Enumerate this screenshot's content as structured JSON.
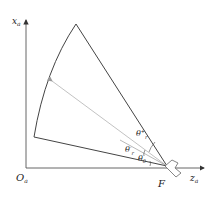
{
  "diagram": {
    "axes": {
      "vertical_label": "x",
      "vertical_subscript": "a",
      "horizontal_label": "z",
      "horizontal_subscript": "a",
      "origin_label": "O",
      "origin_subscript": "a"
    },
    "focus_label": "F",
    "angles": [
      {
        "symbol": "θ",
        "superscript": "+",
        "subscript": "r",
        "name": "theta-r-plus"
      },
      {
        "symbol": "θ",
        "superscript": "-",
        "subscript": "r",
        "name": "theta-r-minus"
      },
      {
        "symbol": "θ",
        "subscript": "0",
        "name": "theta-0"
      }
    ],
    "colors": {
      "outline": "#444444",
      "ray": "#bbbbbb",
      "axis": "#555555"
    }
  }
}
